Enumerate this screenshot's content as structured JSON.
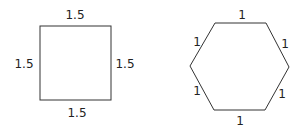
{
  "square": {
    "side_labels": {
      "top": "1.5",
      "left": "1.5",
      "right": "1.5",
      "bottom": "1.5"
    }
  },
  "hexagon": {
    "side_labels": {
      "top": "1",
      "top_left": "1",
      "top_right": "1",
      "bottom_left": "1",
      "bottom_right": "1",
      "bottom": "1"
    }
  },
  "colors": {
    "stroke": "#333333",
    "text": "#222222"
  }
}
